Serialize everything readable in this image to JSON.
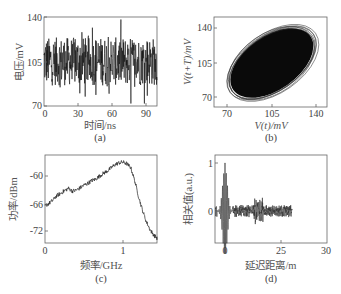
{
  "panels": {
    "a": {
      "caption": "(a)",
      "xlabel": "时间/ns",
      "ylabel": "电压/mV",
      "xticks": [
        "0",
        "30",
        "60",
        "90"
      ],
      "yticks": [
        "140",
        "105",
        "70"
      ]
    },
    "b": {
      "caption": "(b)",
      "xlabel": "V(t)/mV",
      "ylabel": "V(t+T)/mV",
      "xticks": [
        "70",
        "105",
        "140"
      ],
      "yticks": [
        "140",
        "105",
        "70"
      ]
    },
    "c": {
      "caption": "(c)",
      "xlabel": "频率/GHz",
      "ylabel": "功率/dBm",
      "xticks": [
        "0",
        "1"
      ],
      "yticks": [
        "-60",
        "-66",
        "-72"
      ]
    },
    "d": {
      "caption": "(d)",
      "xlabel": "延迟距离/m",
      "ylabel": "相关值(a.u.)",
      "xticks": [
        "0",
        "25",
        "30"
      ],
      "yticks": [
        "1",
        "0"
      ]
    }
  },
  "chart_data": [
    {
      "id": "a",
      "type": "line",
      "title": "",
      "xlabel": "时间/ns",
      "ylabel": "电压/mV",
      "xlim": [
        0,
        100
      ],
      "ylim": [
        70,
        140
      ],
      "xticks": [
        0,
        30,
        60,
        90
      ],
      "yticks": [
        70,
        105,
        140
      ],
      "grid": false,
      "description": "Chaotic voltage time series fluctuating around ~105 mV, roughly between 72 and 138 mV",
      "series": [
        {
          "name": "voltage",
          "mean": 105,
          "min": 72,
          "max": 138
        }
      ]
    },
    {
      "id": "b",
      "type": "scatter",
      "title": "",
      "xlabel": "V(t)/mV",
      "ylabel": "V(t+T)/mV",
      "xlim": [
        62,
        146
      ],
      "ylim": [
        62,
        152
      ],
      "xticks": [
        70,
        105,
        140
      ],
      "yticks": [
        70,
        105,
        140
      ],
      "grid": false,
      "description": "Phase-space attractor: dense elliptical blob along the diagonal from ~(70,72) to ~(140,140)",
      "series": [
        {
          "name": "attractor",
          "center": [
            105,
            105
          ],
          "extent_x": [
            66,
            142
          ],
          "extent_y": [
            68,
            144
          ]
        }
      ]
    },
    {
      "id": "c",
      "type": "line",
      "title": "",
      "xlabel": "频率/GHz",
      "ylabel": "功率/dBm",
      "xlim": [
        0,
        1.44
      ],
      "ylim": [
        -74,
        -56
      ],
      "xticks": [
        0,
        1
      ],
      "yticks": [
        -72,
        -66,
        -60
      ],
      "grid": false,
      "series": [
        {
          "name": "power spectrum",
          "x": [
            0,
            0.05,
            0.1,
            0.15,
            0.2,
            0.25,
            0.3,
            0.35,
            0.4,
            0.45,
            0.5,
            0.55,
            0.6,
            0.65,
            0.7,
            0.75,
            0.8,
            0.85,
            0.9,
            0.95,
            1.0,
            1.05,
            1.1,
            1.15,
            1.2,
            1.25,
            1.3,
            1.35,
            1.4,
            1.44
          ],
          "values": [
            -66.5,
            -66.0,
            -65.3,
            -64.3,
            -63.8,
            -63.2,
            -62.7,
            -63.3,
            -63.1,
            -62.6,
            -62.0,
            -61.6,
            -61.0,
            -60.7,
            -60.0,
            -59.4,
            -58.9,
            -58.2,
            -57.5,
            -57.1,
            -57.0,
            -57.3,
            -58.2,
            -61.0,
            -64.5,
            -67.5,
            -70.0,
            -71.8,
            -73.0,
            -73.6
          ]
        }
      ]
    },
    {
      "id": "d",
      "type": "line",
      "title": "",
      "xlabel": "延迟距离/m",
      "ylabel": "相关值(a.u.)",
      "xlim": [
        -2,
        30
      ],
      "ylim": [
        -0.95,
        1.15
      ],
      "xticks": [
        0,
        25,
        30
      ],
      "yticks": [
        0,
        1
      ],
      "grid": false,
      "description": "Autocorrelation: sharp peak of 1 at 0 m, strong oscillating side lobes near 0 (down to ~-0.9), small fluctuations elsewhere, weak bump near ~15 m",
      "series": [
        {
          "name": "correlation",
          "peak": {
            "x": 0,
            "y": 1.0
          },
          "min": {
            "x": 0.3,
            "y": -0.9
          }
        }
      ]
    }
  ]
}
